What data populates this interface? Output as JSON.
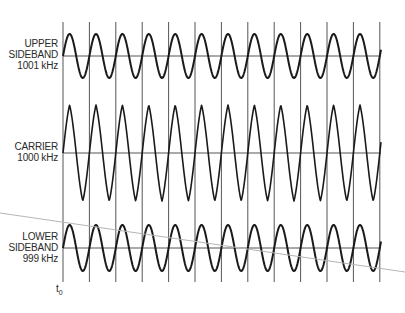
{
  "diagram": {
    "type": "waveform-diagram",
    "signals": [
      {
        "id": "upper",
        "label_line1": "UPPER",
        "label_line2": "SIDEBAND",
        "label_line3": "1001 kHz",
        "center_y": 56,
        "amplitude": 22,
        "shape": "flat-top"
      },
      {
        "id": "carrier",
        "label_line1": "CARRIER",
        "label_line2": "1000 kHz",
        "center_y": 153,
        "amplitude": 48,
        "shape": "peaked"
      },
      {
        "id": "lower",
        "label_line1": "LOWER",
        "label_line2": "SIDEBAND",
        "label_line3": "999 kHz",
        "center_y": 248,
        "amplitude": 23,
        "shape": "flat-top"
      }
    ],
    "time_origin_label": "t",
    "time_origin_sub": "0",
    "gridlines": {
      "x_start": 63,
      "spacing": 26.4,
      "count": 13,
      "y_top": 22,
      "y_bottom": 282
    },
    "axis_x_start": 63,
    "axis_x_end": 381,
    "period_px": 26.4,
    "diagonal_line": {
      "x1": 0,
      "y1": 213,
      "x2": 405,
      "y2": 272,
      "color": "#b5b5b5"
    },
    "colors": {
      "wave": "#1a1a1a",
      "grid": "#555555",
      "axis": "#555555",
      "text": "#2a2a2a"
    }
  }
}
